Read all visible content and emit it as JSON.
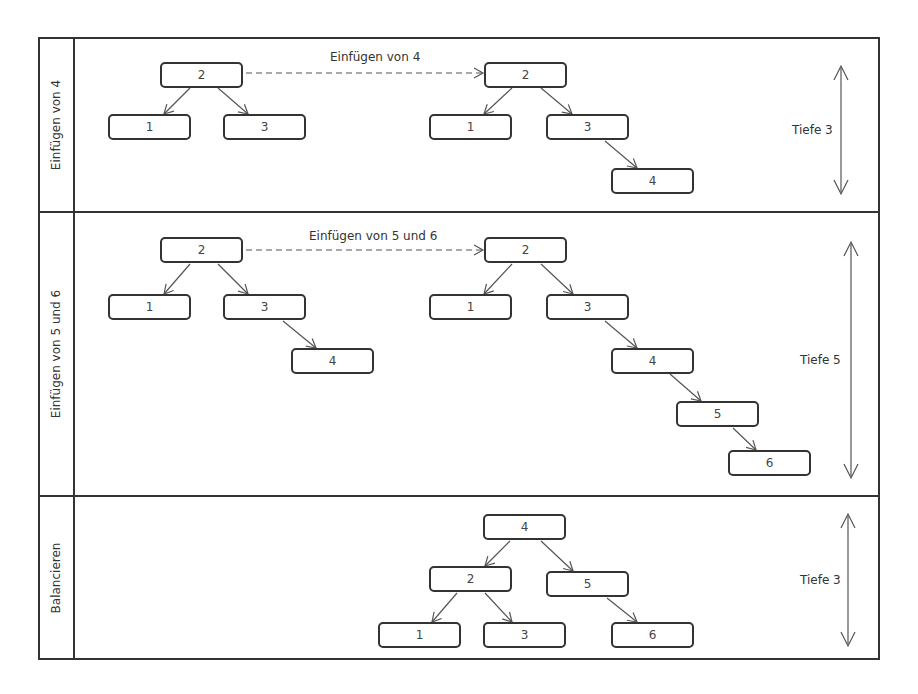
{
  "lanes": [
    {
      "label": "Einfügen von 4",
      "depth_label": "Tiefe 3",
      "transition_label": "Einfügen von 4"
    },
    {
      "label": "Einfügen von 5 und 6",
      "depth_label": "Tiefe 5",
      "transition_label": "Einfügen von 5 und 6"
    },
    {
      "label": "Balancieren",
      "depth_label": "Tiefe 3"
    }
  ],
  "trees": {
    "lane1_before": {
      "root": "2",
      "left": "1",
      "right": "3"
    },
    "lane1_after": {
      "root": "2",
      "left": "1",
      "right": "3",
      "right_right": "4"
    },
    "lane2_before": {
      "root": "2",
      "left": "1",
      "right": "3",
      "right_right": "4"
    },
    "lane2_after": {
      "root": "2",
      "left": "1",
      "right": "3",
      "n4": "4",
      "n5": "5",
      "n6": "6"
    },
    "lane3_balanced": {
      "root": "4",
      "left": "2",
      "right": "5",
      "left_left": "1",
      "left_right": "3",
      "right_right": "6"
    }
  },
  "colors": {
    "line": "#333333",
    "arrow": "#555555",
    "background": "#ffffff"
  }
}
